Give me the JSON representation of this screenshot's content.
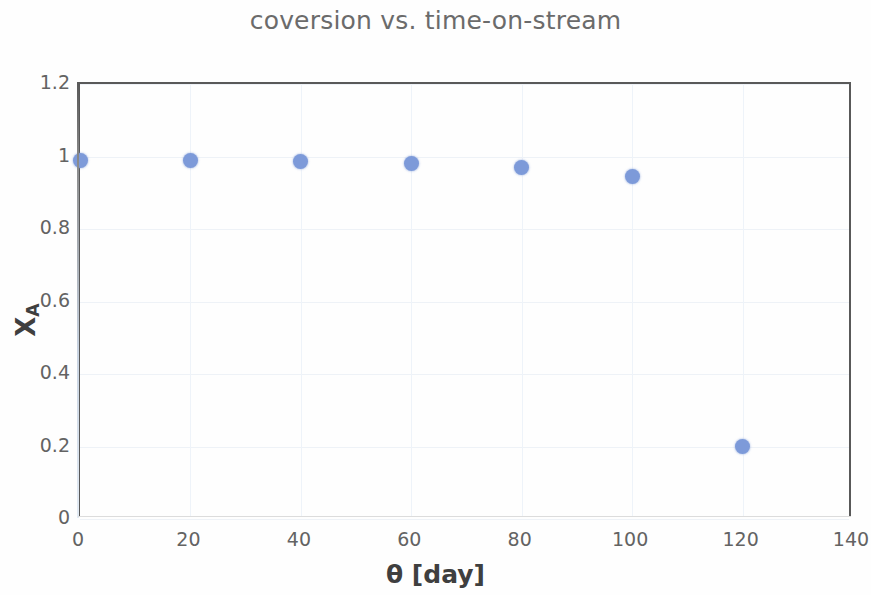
{
  "chart_data": {
    "type": "scatter",
    "title": "coversion vs. time-on-stream",
    "xlabel": "θ [day]",
    "ylabel": "X",
    "ylabel_subscript": "A",
    "x": [
      0,
      20,
      40,
      60,
      80,
      100,
      120
    ],
    "values": [
      0.99,
      0.99,
      0.985,
      0.98,
      0.97,
      0.945,
      0.2
    ],
    "series": [
      {
        "name": "X_A",
        "points": [
          {
            "x": 0,
            "y": 0.99
          },
          {
            "x": 20,
            "y": 0.99
          },
          {
            "x": 40,
            "y": 0.985
          },
          {
            "x": 60,
            "y": 0.98
          },
          {
            "x": 80,
            "y": 0.97
          },
          {
            "x": 100,
            "y": 0.945
          },
          {
            "x": 120,
            "y": 0.2
          }
        ],
        "marker_color": "#7d9ad9",
        "marker_shape": "circle"
      }
    ],
    "xlim": [
      0,
      140
    ],
    "ylim": [
      0,
      1.2
    ],
    "xticks": [
      "0",
      "20",
      "40",
      "60",
      "80",
      "100",
      "120",
      "140"
    ],
    "xtick_values": [
      0,
      20,
      40,
      60,
      80,
      100,
      120,
      140
    ],
    "yticks": [
      "0",
      "0.2",
      "0.4",
      "0.6",
      "0.8",
      "1",
      "1.2"
    ],
    "ytick_values": [
      0,
      0.2,
      0.4,
      0.6,
      0.8,
      1,
      1.2
    ],
    "grid": "faint",
    "legend": "none",
    "title_color": "#6b6b6b",
    "axis_color": "#595959",
    "tick_label_color": "#636363",
    "axis_title_color": "#3f3f3f",
    "background_color": "#fefefe"
  }
}
